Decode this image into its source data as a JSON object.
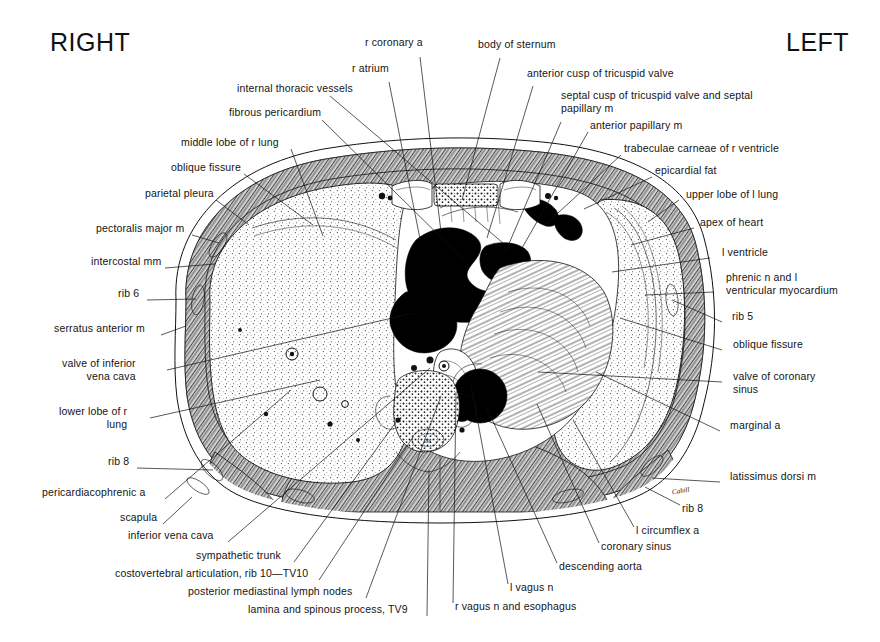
{
  "figure": {
    "title_right": "RIGHT",
    "title_left": "LEFT",
    "signature": "Cahill",
    "type": "anatomical-cross-section"
  },
  "labels_left": [
    {
      "id": "internal-thoracic-vessels",
      "text": "internal thoracic vessels",
      "x": 237,
      "y": 90,
      "anchor": "end",
      "tx": 330,
      "ty": 96,
      "px": 503,
      "py": 243
    },
    {
      "id": "fibrous-pericardium",
      "text": "fibrous pericardium",
      "x": 229,
      "y": 114,
      "anchor": "end",
      "tx": 322,
      "ty": 120,
      "px": 466,
      "py": 262
    },
    {
      "id": "middle-lobe-of-r-lung",
      "text": "middle lobe of r lung",
      "x": 181,
      "y": 144,
      "anchor": "end",
      "tx": 291,
      "ty": 149,
      "px": 323,
      "py": 236
    },
    {
      "id": "oblique-fissure-r",
      "text": "oblique fissure",
      "x": 171,
      "y": 169,
      "anchor": "end",
      "tx": 244,
      "ty": 174,
      "px": 313,
      "py": 225
    },
    {
      "id": "parietal-pleura",
      "text": "parietal pleura",
      "x": 145,
      "y": 195,
      "anchor": "end",
      "tx": 216,
      "ty": 200,
      "px": 249,
      "py": 225
    },
    {
      "id": "pectoralis-major-m",
      "text": "pectoralis major m",
      "x": 96,
      "y": 230,
      "anchor": "end",
      "tx": 192,
      "ty": 235,
      "px": 219,
      "py": 243
    },
    {
      "id": "intercostal-mm",
      "text": "intercostal mm",
      "x": 91,
      "y": 263,
      "anchor": "end",
      "tx": 165,
      "ty": 268,
      "px": 215,
      "py": 264
    },
    {
      "id": "rib-6",
      "text": "rib 6",
      "x": 118,
      "y": 295,
      "anchor": "end",
      "tx": 147,
      "ty": 300,
      "px": 196,
      "py": 299
    },
    {
      "id": "serratus-anterior-m",
      "text": "serratus anterior m",
      "x": 54,
      "y": 330,
      "anchor": "end",
      "tx": 161,
      "ty": 335,
      "px": 186,
      "py": 326
    },
    {
      "id": "valve-of-inferior-vena-cava",
      "text": "valve of inferior",
      "text2": "vena cava",
      "x": 62,
      "y": 365,
      "anchor": "end",
      "tx": 167,
      "ty": 370,
      "px": 414,
      "py": 313
    },
    {
      "id": "lower-lobe-of-r-lung",
      "text": "lower lobe of r",
      "text2": "lung",
      "x": 59,
      "y": 413,
      "anchor": "end",
      "tx": 150,
      "ty": 418,
      "px": 320,
      "py": 380
    },
    {
      "id": "rib-8-left",
      "text": "rib 8",
      "x": 108,
      "y": 463,
      "anchor": "end",
      "tx": 137,
      "ty": 468,
      "px": 213,
      "py": 470
    },
    {
      "id": "pericardiacophrenic-a",
      "text": "pericardiacophrenic a",
      "x": 42,
      "y": 494,
      "anchor": "end",
      "tx": 165,
      "ty": 499,
      "px": 291,
      "py": 390
    },
    {
      "id": "scapula",
      "text": "scapula",
      "x": 120,
      "y": 519,
      "anchor": "end",
      "tx": 163,
      "ty": 524,
      "px": 192,
      "py": 497
    },
    {
      "id": "inferior-vena-cava",
      "text": "inferior vena cava",
      "x": 128,
      "y": 537,
      "anchor": "end",
      "tx": 228,
      "ty": 542,
      "px": 430,
      "py": 368
    },
    {
      "id": "sympathetic-trunk",
      "text": "sympathetic trunk",
      "x": 196,
      "y": 557,
      "anchor": "end",
      "tx": 294,
      "ty": 562,
      "px": 399,
      "py": 418
    },
    {
      "id": "costovertebral-articulation",
      "text": "costovertebral articulation, rib 10—TV10",
      "x": 115,
      "y": 575,
      "anchor": "end",
      "tx": 319,
      "ty": 580,
      "px": 413,
      "py": 437
    },
    {
      "id": "posterior-mediastinal-lymph-nodes",
      "text": "posterior mediastinal lymph nodes",
      "x": 188,
      "y": 593,
      "anchor": "end",
      "tx": 366,
      "ty": 598,
      "px": 441,
      "py": 396
    },
    {
      "id": "lamina-and-spinous-process",
      "text": "lamina and spinous process, TV9",
      "x": 248,
      "y": 611,
      "anchor": "end",
      "tx": 427,
      "ty": 616,
      "px": 429,
      "py": 470
    }
  ],
  "labels_top": [
    {
      "id": "r-coronary-a",
      "text": "r coronary a",
      "x": 365,
      "y": 44,
      "anchor": "start",
      "tx": 420,
      "ty": 57,
      "px": 441,
      "py": 232
    },
    {
      "id": "r-atrium",
      "text": "r atrium",
      "x": 352,
      "y": 70,
      "anchor": "start",
      "tx": 389,
      "ty": 82,
      "px": 420,
      "py": 239
    },
    {
      "id": "body-of-sternum",
      "text": "body of sternum",
      "x": 478,
      "y": 46,
      "anchor": "start",
      "tx": 500,
      "ty": 58,
      "px": 462,
      "py": 200
    }
  ],
  "labels_right": [
    {
      "id": "anterior-cusp-of-tricuspid-valve",
      "text": "anterior cusp of tricuspid valve",
      "x": 527,
      "y": 75,
      "anchor": "start",
      "tx": 533,
      "ty": 86,
      "px": 487,
      "py": 238
    },
    {
      "id": "septal-cusp-of-tricuspid-valve",
      "text": "septal cusp of tricuspid valve and septal",
      "text2": "papillary m",
      "x": 561,
      "y": 97,
      "anchor": "start",
      "tx": 561,
      "ty": 122,
      "px": 505,
      "py": 253
    },
    {
      "id": "anterior-papillary-m",
      "text": "anterior papillary m",
      "x": 590,
      "y": 127,
      "anchor": "start",
      "tx": 588,
      "ty": 132,
      "px": 522,
      "py": 248
    },
    {
      "id": "trabeculae-carneae",
      "text": "trabeculae carneae of r ventricle",
      "x": 624,
      "y": 150,
      "anchor": "start",
      "tx": 621,
      "ty": 155,
      "px": 545,
      "py": 225
    },
    {
      "id": "epicardial-fat",
      "text": "epicardial fat",
      "x": 655,
      "y": 172,
      "anchor": "start",
      "tx": 652,
      "ty": 177,
      "px": 584,
      "py": 209
    },
    {
      "id": "upper-lobe-of-l-lung",
      "text": "upper lobe of l lung",
      "x": 686,
      "y": 196,
      "anchor": "start",
      "tx": 679,
      "ty": 200,
      "px": 648,
      "py": 222
    },
    {
      "id": "apex-of-heart",
      "text": "apex of heart",
      "x": 700,
      "y": 224,
      "anchor": "start",
      "tx": 694,
      "ty": 228,
      "px": 631,
      "py": 245
    },
    {
      "id": "l-ventricle",
      "text": "l ventricle",
      "x": 722,
      "y": 254,
      "anchor": "start",
      "tx": 710,
      "ty": 258,
      "px": 612,
      "py": 272
    },
    {
      "id": "phrenic-n-and-l-ventricular-myocardium",
      "text": "phrenic n and l",
      "text2": "ventricular myocardium",
      "x": 726,
      "y": 279,
      "anchor": "start",
      "tx": 714,
      "ty": 292,
      "px": 645,
      "py": 295
    },
    {
      "id": "rib-5",
      "text": "rib 5",
      "x": 732,
      "y": 318,
      "anchor": "start",
      "tx": 722,
      "ty": 322,
      "px": 672,
      "py": 300
    },
    {
      "id": "oblique-fissure-l",
      "text": "oblique fissure",
      "x": 733,
      "y": 346,
      "anchor": "start",
      "tx": 722,
      "ty": 350,
      "px": 620,
      "py": 318
    },
    {
      "id": "valve-of-coronary-sinus",
      "text": "valve of coronary",
      "text2": "sinus",
      "x": 733,
      "y": 378,
      "anchor": "start",
      "tx": 722,
      "ty": 382,
      "px": 538,
      "py": 372
    },
    {
      "id": "marginal-a",
      "text": "marginal a",
      "x": 730,
      "y": 427,
      "anchor": "start",
      "tx": 720,
      "ty": 431,
      "px": 596,
      "py": 372
    },
    {
      "id": "latissimus-dorsi-m",
      "text": "latissimus dorsi m",
      "x": 730,
      "y": 478,
      "anchor": "start",
      "tx": 720,
      "ty": 482,
      "px": 652,
      "py": 478
    }
  ],
  "labels_bottom": [
    {
      "id": "rib-8-right",
      "text": "rib 8",
      "x": 682,
      "y": 510,
      "anchor": "start",
      "tx": 680,
      "ty": 505,
      "px": 645,
      "py": 487
    },
    {
      "id": "l-circumflex-a",
      "text": "l circumflex a",
      "x": 636,
      "y": 532,
      "anchor": "start",
      "tx": 634,
      "ty": 527,
      "px": 573,
      "py": 420
    },
    {
      "id": "coronary-sinus",
      "text": "coronary sinus",
      "x": 601,
      "y": 548,
      "anchor": "start",
      "tx": 599,
      "ty": 543,
      "px": 537,
      "py": 404
    },
    {
      "id": "descending-aorta",
      "text": "descending aorta",
      "x": 559,
      "y": 568,
      "anchor": "start",
      "tx": 557,
      "ty": 563,
      "px": 487,
      "py": 408
    },
    {
      "id": "l-vagus-n",
      "text": "l vagus n",
      "x": 510,
      "y": 589,
      "anchor": "start",
      "tx": 508,
      "ty": 584,
      "px": 471,
      "py": 385
    },
    {
      "id": "r-vagus-n-and-esophagus",
      "text": "r vagus n and esophagus",
      "x": 455,
      "y": 608,
      "anchor": "start",
      "tx": 453,
      "ty": 603,
      "px": 456,
      "py": 392
    }
  ]
}
